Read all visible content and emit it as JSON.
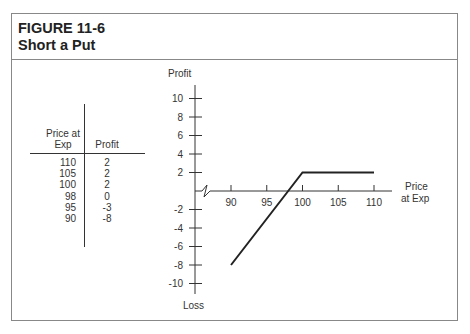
{
  "figure": {
    "number": "FIGURE 11-6",
    "title": "Short a Put"
  },
  "table": {
    "headers": [
      "Price at Exp",
      "Profit"
    ],
    "header_lines": [
      "Price at",
      "Exp"
    ],
    "rows": [
      {
        "price": "110",
        "profit": "2"
      },
      {
        "price": "105",
        "profit": "2"
      },
      {
        "price": "100",
        "profit": "2"
      },
      {
        "price": "98",
        "profit": "0"
      },
      {
        "price": "95",
        "profit": "-3"
      },
      {
        "price": "90",
        "profit": "-8"
      }
    ]
  },
  "chart_data": {
    "type": "line",
    "title": "Short a Put",
    "xlabel": "Price at Exp",
    "ylabel_top": "Profit",
    "ylabel_bottom": "Loss",
    "x": [
      90,
      95,
      98,
      100,
      105,
      110
    ],
    "series": [
      {
        "name": "Profit",
        "values": [
          -8,
          -3,
          0,
          2,
          2,
          2
        ]
      }
    ],
    "x_ticks": [
      "90",
      "95",
      "100",
      "105",
      "110"
    ],
    "y_ticks": [
      "10",
      "8",
      "6",
      "4",
      "2",
      "-2",
      "-4",
      "-6",
      "-8",
      "-10"
    ],
    "xlim": [
      85,
      112
    ],
    "ylim": [
      -11,
      11
    ],
    "grid": false,
    "axis_break": true,
    "line_color": "#222222"
  }
}
